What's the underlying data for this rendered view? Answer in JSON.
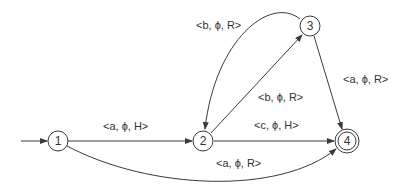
{
  "diagram": {
    "type": "state-transition-diagram",
    "start_state": "1",
    "nodes": [
      {
        "id": "1",
        "label": "1",
        "accepting": false
      },
      {
        "id": "2",
        "label": "2",
        "accepting": false
      },
      {
        "id": "3",
        "label": "3",
        "accepting": false
      },
      {
        "id": "4",
        "label": "4",
        "accepting": true
      }
    ],
    "edges": [
      {
        "from": "1",
        "to": "2",
        "label": "<a, ϕ, H>"
      },
      {
        "from": "1",
        "to": "4",
        "label": "<a, ϕ, R>"
      },
      {
        "from": "2",
        "to": "3",
        "label": "<b, ϕ, R>"
      },
      {
        "from": "3",
        "to": "2",
        "label": "<b, ϕ, R>"
      },
      {
        "from": "2",
        "to": "4",
        "label": "<c, ϕ, H>"
      },
      {
        "from": "3",
        "to": "4",
        "label": "<a, ϕ, R>"
      }
    ]
  }
}
